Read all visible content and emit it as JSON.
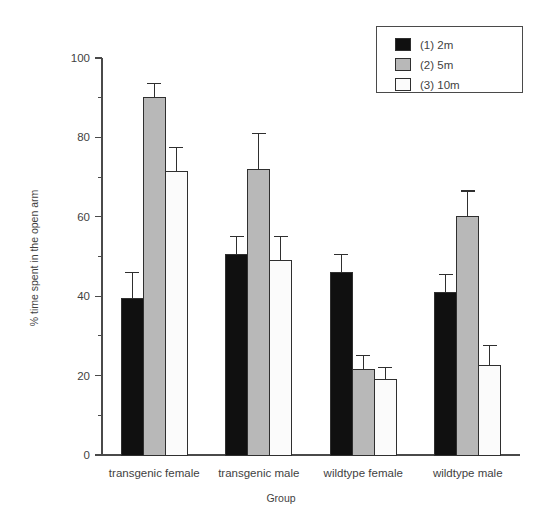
{
  "chart_data": {
    "type": "bar",
    "title": "",
    "xlabel": "Group",
    "ylabel": "% time spent in the open arm",
    "categories": [
      "transgenic female",
      "transgenic male",
      "wildtype female",
      "wildtype male"
    ],
    "series": [
      {
        "name": "(1) 2m",
        "color": "#101010",
        "values": [
          39.5,
          50.5,
          46.0,
          41.0
        ],
        "errors": [
          6.5,
          4.5,
          4.5,
          4.5
        ]
      },
      {
        "name": "(2) 5m",
        "color": "#b8b8b8",
        "values": [
          90.0,
          72.0,
          21.5,
          60.0
        ],
        "errors": [
          3.5,
          9.0,
          3.5,
          6.5
        ]
      },
      {
        "name": "(3) 10m",
        "color": "#fbfbfb",
        "values": [
          71.5,
          49.0,
          19.0,
          22.5
        ],
        "errors": [
          6.0,
          6.0,
          3.0,
          5.0
        ]
      }
    ],
    "ylim": [
      0,
      100
    ],
    "yticks": [
      0,
      20,
      40,
      60,
      80,
      100
    ],
    "yticklabels": [
      "0",
      "20",
      "40",
      "60",
      "80",
      "100"
    ],
    "yminorticks": [
      10,
      30,
      50,
      70,
      90
    ],
    "grid": false,
    "legend_position": "top-right"
  },
  "legend": {
    "entries": [
      {
        "label": "(1) 2m"
      },
      {
        "label": "(2) 5m"
      },
      {
        "label": "(3) 10m"
      }
    ]
  },
  "axis": {
    "y_title": "% time spent in the open arm",
    "x_title": "Group"
  }
}
